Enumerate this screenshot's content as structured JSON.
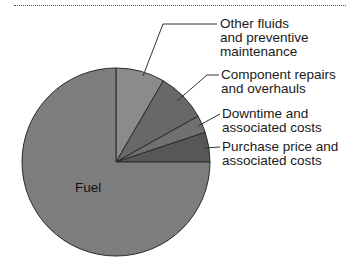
{
  "chart_data": {
    "type": "pie",
    "title": "",
    "start_angle_deg": 0,
    "direction": "clockwise",
    "slices": [
      {
        "label": "Other fluids and preventive maintenance",
        "value": 8.4,
        "color": "#8b8b8b"
      },
      {
        "label": "Component repairs and overhauls",
        "value": 8.5,
        "color": "#686868"
      },
      {
        "label": "Downtime and associated costs",
        "value": 3.0,
        "color": "#707070"
      },
      {
        "label": "Purchase price and associated costs",
        "value": 5.1,
        "color": "#575757"
      },
      {
        "label": "Fuel",
        "value": 75.0,
        "color": "#7d7d7d"
      }
    ]
  },
  "labels": {
    "other_fluids": "Other fluids\nand preventive\nmaintenance",
    "component_repairs": "Component repairs\nand overhauls",
    "downtime": "Downtime and\nassociated costs",
    "purchase_price": "Purchase price and\nassociated costs",
    "fuel": "Fuel"
  }
}
